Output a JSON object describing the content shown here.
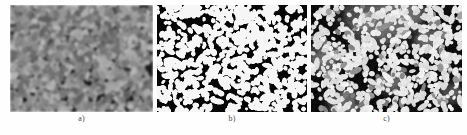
{
  "figure": {
    "type": "micrograph-panel-series",
    "background_color": "#fefefe",
    "label_color": "#4a4a4a",
    "panel_count": 3
  },
  "panels": [
    {
      "id": "a",
      "label": "a)",
      "description": "original grayscale micrograph",
      "render": "grayscale",
      "x": 10,
      "y": 5,
      "width": 143,
      "height": 107,
      "background_color": "#171717",
      "blob_color": "#b9b9b9",
      "blob_count": 1500,
      "blob_radius_min": 1.6,
      "blob_radius_max": 3.4,
      "blur": 1.1,
      "noise": 26,
      "bright_patches": [
        {
          "cx": 0.3,
          "cy": 0.18,
          "r": 0.3,
          "strength": 0.2
        },
        {
          "cx": 0.62,
          "cy": 0.05,
          "r": 0.22,
          "strength": 0.26
        },
        {
          "cx": 0.12,
          "cy": 0.55,
          "r": 0.26,
          "strength": 0.12
        },
        {
          "cx": 0.86,
          "cy": 0.4,
          "r": 0.24,
          "strength": 0.1
        }
      ],
      "dark_patches": [
        {
          "cx": 0.52,
          "cy": 0.45,
          "r": 0.28,
          "strength": 0.22
        },
        {
          "cx": 0.2,
          "cy": 0.85,
          "r": 0.24,
          "strength": 0.14
        }
      ]
    },
    {
      "id": "b",
      "label": "b)",
      "description": "binary thresholded segmentation",
      "render": "binary",
      "x": 157,
      "y": 5,
      "width": 150,
      "height": 107,
      "background_color": "#060606",
      "blob_color": "#f6f6f6",
      "blob_count": 760,
      "blob_radius_min": 1.5,
      "blob_radius_max": 3.2,
      "blur": 0,
      "noise": 0,
      "bright_patches": [],
      "dark_patches": []
    },
    {
      "id": "c",
      "label": "c)",
      "description": "segmentation overlaid on original with grey regions",
      "render": "hybrid",
      "x": 311,
      "y": 5,
      "width": 151,
      "height": 107,
      "background_color": "#0c0c0c",
      "blob_color": "#f2f2f2",
      "grey_color": "#6e6e6e",
      "blob_count": 700,
      "blob_radius_min": 1.5,
      "blob_radius_max": 3.2,
      "blur": 0.35,
      "noise": 16,
      "bright_patches": [],
      "dark_patches": [],
      "grey_regions": [
        {
          "cx": 0.44,
          "cy": 0.1,
          "r": 0.24,
          "strength": 0.85
        },
        {
          "cx": 0.62,
          "cy": 0.05,
          "r": 0.16,
          "strength": 0.7
        },
        {
          "cx": 0.09,
          "cy": 0.5,
          "r": 0.13,
          "strength": 0.55
        },
        {
          "cx": 0.78,
          "cy": 0.33,
          "r": 0.12,
          "strength": 0.45
        },
        {
          "cx": 0.22,
          "cy": 0.93,
          "r": 0.14,
          "strength": 0.5
        },
        {
          "cx": 0.55,
          "cy": 0.72,
          "r": 0.11,
          "strength": 0.4
        },
        {
          "cx": 0.93,
          "cy": 0.82,
          "r": 0.1,
          "strength": 0.4
        }
      ]
    }
  ]
}
